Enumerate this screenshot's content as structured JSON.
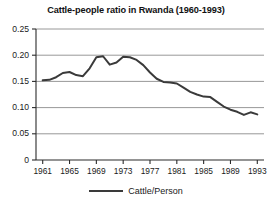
{
  "chart_data": {
    "type": "line",
    "title": "Cattle-people ratio in Rwanda (1960-1993)",
    "xlabel": "",
    "ylabel": "",
    "grid": "horizontal",
    "legend_position": "bottom-center",
    "xlim": [
      1960,
      1994
    ],
    "ylim": [
      0,
      0.25
    ],
    "ytick_labels": [
      "0.25",
      "0.20",
      "0.15",
      "0.10",
      "0.05",
      "0"
    ],
    "ytick_values": [
      0.25,
      0.2,
      0.15,
      0.1,
      0.05,
      0
    ],
    "xtick_labels": [
      "1961",
      "1965",
      "1969",
      "1973",
      "1977",
      "1981",
      "1985",
      "1989",
      "1993"
    ],
    "xtick_values": [
      1961,
      1965,
      1969,
      1973,
      1977,
      1981,
      1985,
      1989,
      1993
    ],
    "series": [
      {
        "name": "Cattle/Person",
        "color": "#3a3a3a",
        "x": [
          1961,
          1962,
          1963,
          1964,
          1965,
          1966,
          1967,
          1968,
          1969,
          1970,
          1971,
          1972,
          1973,
          1974,
          1975,
          1976,
          1977,
          1978,
          1979,
          1980,
          1981,
          1982,
          1983,
          1984,
          1985,
          1986,
          1987,
          1988,
          1989,
          1990,
          1991,
          1992,
          1993
        ],
        "values": [
          0.152,
          0.153,
          0.158,
          0.166,
          0.168,
          0.162,
          0.16,
          0.175,
          0.196,
          0.198,
          0.182,
          0.186,
          0.197,
          0.196,
          0.191,
          0.181,
          0.167,
          0.155,
          0.149,
          0.148,
          0.146,
          0.138,
          0.13,
          0.125,
          0.121,
          0.12,
          0.111,
          0.102,
          0.096,
          0.092,
          0.086,
          0.091,
          0.087
        ]
      }
    ]
  },
  "legend": {
    "entries": [
      {
        "label": "Cattle/Person",
        "marker": "line-marker"
      }
    ]
  }
}
